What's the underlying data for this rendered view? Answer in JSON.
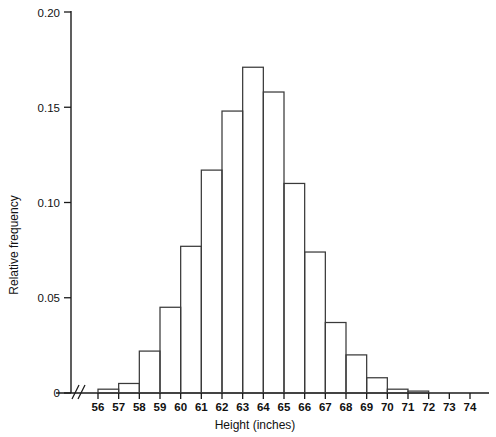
{
  "chart_data": {
    "type": "bar",
    "title": "",
    "xlabel": "Height (inches)",
    "ylabel": "Relative frequency",
    "bin_edges": [
      56,
      57,
      58,
      59,
      60,
      61,
      62,
      63,
      64,
      65,
      66,
      67,
      68,
      69,
      70,
      71,
      72,
      73,
      74
    ],
    "categories": [
      "56-57",
      "57-58",
      "58-59",
      "59-60",
      "60-61",
      "61-62",
      "62-63",
      "63-64",
      "64-65",
      "65-66",
      "66-67",
      "67-68",
      "68-69",
      "69-70",
      "70-71",
      "71-72",
      "72-73",
      "73-74"
    ],
    "values": [
      0.002,
      0.005,
      0.022,
      0.045,
      0.077,
      0.117,
      0.148,
      0.171,
      0.158,
      0.11,
      0.074,
      0.037,
      0.02,
      0.008,
      0.002,
      0.001,
      0.0,
      0.0
    ],
    "xtick_labels": [
      "56",
      "57",
      "58",
      "59",
      "60",
      "61",
      "62",
      "63",
      "64",
      "65",
      "66",
      "67",
      "68",
      "69",
      "70",
      "71",
      "72",
      "73",
      "74"
    ],
    "ytick_labels": [
      "0",
      "0.05",
      "0.10",
      "0.15",
      "0.20"
    ],
    "ytick_values": [
      0,
      0.05,
      0.1,
      0.15,
      0.2
    ],
    "ylim": [
      0,
      0.2
    ],
    "xlim": [
      56,
      74
    ],
    "grid": false,
    "legend": false,
    "x_axis_break": true,
    "bar_fill": "#ffffff",
    "bar_stroke": "#3a3a3a",
    "axis_color": "#1a1a1a"
  },
  "axes": {
    "y_title": "Relative frequency",
    "x_title": "Height (inches)"
  }
}
